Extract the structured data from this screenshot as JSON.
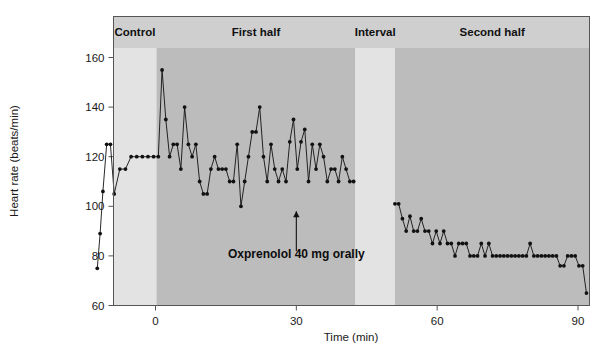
{
  "figure": {
    "background": "#ffffff",
    "plot_border_color": "#555555",
    "header_band_color": "#cfcfcf",
    "light_band_color": "#e3e3e3",
    "dark_band_color": "#bcbcbc",
    "series_color": "#111111"
  },
  "chart_data": {
    "type": "line",
    "title": "",
    "subtitle": "",
    "xlabel": "Time (min)",
    "ylabel": "Heart rate (beats/min)",
    "xlim": [
      -13,
      93
    ],
    "ylim": [
      60,
      160
    ],
    "xticks": [
      0,
      30,
      60,
      90
    ],
    "xtick_labels": [
      "0",
      "30",
      "60",
      "90"
    ],
    "yticks": [
      60,
      80,
      100,
      120,
      140,
      160
    ],
    "ytick_labels": [
      "60",
      "80",
      "100",
      "120",
      "140",
      "160"
    ],
    "grid": false,
    "legend": "none",
    "marker": "filled-circle",
    "series": [
      {
        "name": "Heart rate",
        "x": [
          -12.4,
          -11.8,
          -11.2,
          -10.4,
          -9.6,
          -8.8,
          -7.6,
          -6.4,
          -5.2,
          -4.0,
          -2.8,
          -1.6,
          -0.4,
          0.6,
          1.4,
          2.2,
          3.0,
          3.8,
          4.6,
          5.4,
          6.2,
          7.0,
          7.8,
          8.6,
          9.4,
          10.2,
          11.0,
          11.8,
          12.6,
          13.4,
          14.2,
          15.0,
          15.8,
          16.6,
          17.4,
          18.2,
          19.0,
          19.8,
          20.6,
          21.4,
          22.2,
          23.0,
          23.8,
          24.6,
          25.4,
          26.2,
          27.0,
          27.8,
          28.6,
          29.4,
          30.2,
          31.0,
          31.8,
          32.6,
          33.4,
          34.2,
          35.0,
          35.8,
          36.6,
          37.4,
          38.2,
          39.0,
          39.8,
          40.6,
          41.4,
          42.2,
          51.0,
          51.8,
          52.6,
          53.4,
          54.2,
          55.0,
          55.8,
          56.6,
          57.4,
          58.2,
          59.0,
          59.8,
          60.6,
          61.4,
          62.2,
          63.0,
          63.8,
          64.6,
          65.4,
          66.2,
          67.0,
          67.8,
          68.6,
          69.4,
          70.2,
          71.0,
          71.8,
          72.6,
          73.4,
          74.2,
          75.0,
          75.8,
          76.6,
          77.4,
          78.2,
          79.0,
          79.8,
          80.6,
          81.4,
          82.2,
          83.0,
          83.8,
          84.6,
          85.4,
          86.2,
          87.0,
          87.8,
          88.6,
          89.4,
          90.2,
          91.0,
          91.8
        ],
        "y": [
          75,
          89,
          106,
          125,
          125,
          105,
          115,
          115,
          120,
          120,
          120,
          120,
          120,
          120,
          155,
          135,
          120,
          125,
          125,
          115,
          140,
          125,
          120,
          125,
          110,
          105,
          105,
          115,
          120,
          115,
          115,
          115,
          110,
          110,
          125,
          100,
          110,
          120,
          130,
          130,
          140,
          120,
          110,
          125,
          115,
          110,
          115,
          110,
          126,
          135,
          115,
          126,
          131,
          110,
          125,
          115,
          125,
          120,
          110,
          115,
          115,
          110,
          120,
          115,
          110,
          110,
          101,
          101,
          95,
          90,
          96,
          90,
          90,
          95,
          90,
          90,
          85,
          90,
          85,
          90,
          85,
          85,
          80,
          85,
          85,
          85,
          80,
          80,
          80,
          85,
          80,
          85,
          80,
          80,
          80,
          80,
          80,
          80,
          80,
          80,
          80,
          80,
          85,
          80,
          80,
          80,
          80,
          80,
          80,
          80,
          76,
          76,
          80,
          80,
          80,
          76,
          76,
          65
        ]
      }
    ],
    "bands": [
      {
        "label": "Control",
        "x_start": -13,
        "x_end": 0.2,
        "shade": "light"
      },
      {
        "label": "First half",
        "x_start": 0.2,
        "x_end": 42.6,
        "shade": "dark"
      },
      {
        "label": "Interval",
        "x_start": 42.6,
        "x_end": 51.0,
        "shade": "light"
      },
      {
        "label": "Second half",
        "x_start": 51.0,
        "x_end": 93,
        "shade": "dark"
      }
    ],
    "annotations": [
      {
        "text": "Oxprenolol 40 mg orally",
        "arrow_x": 30,
        "arrow_y_tip": 98,
        "arrow_y_base": 82,
        "label_x": 30,
        "label_y": 79
      }
    ]
  }
}
